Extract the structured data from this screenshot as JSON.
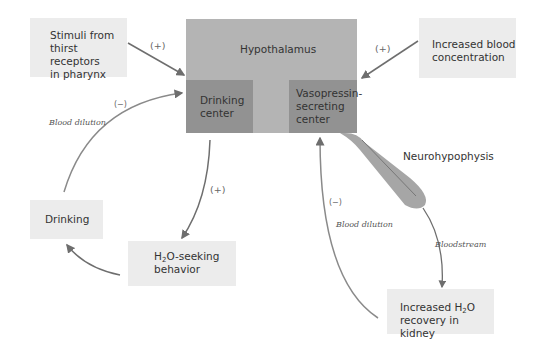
{
  "diagram": {
    "nodes": {
      "stimuli": {
        "line1": "Stimuli from",
        "line2": "thirst receptors",
        "line3": "in  pharynx"
      },
      "blood_conc": {
        "line1": "Increased blood",
        "line2": "concentration"
      },
      "hypothalamus": {
        "label": "Hypothalamus"
      },
      "drinking_center": {
        "line1": "Drinking",
        "line2": "center"
      },
      "vasopressin_center": {
        "line1": "Vasopressin-",
        "line2": "secreting",
        "line3": "center"
      },
      "neurohypophysis": {
        "label": "Neurohypophysis"
      },
      "drinking": {
        "label": "Drinking"
      },
      "h2o_seeking": {
        "line1_pre": "H",
        "line1_sub": "2",
        "line1_post": "O-seeking",
        "line2": "behavior"
      },
      "h2o_recovery": {
        "line1_pre": "Increased H",
        "line1_sub": "2",
        "line1_post": "O",
        "line2": "recovery in kidney"
      }
    },
    "edge_labels": {
      "stimuli_plus": "(+)",
      "blood_conc_plus": "(+)",
      "drinking_center_plus": "(+)",
      "left_minus": "(−)",
      "left_blood_dilution": "Blood dilution",
      "right_minus": "(−)",
      "right_blood_dilution": "Blood dilution",
      "bloodstream": "Bloodstream"
    },
    "colors": {
      "hypothalamus": "#b4b4b4",
      "centers": "#929292",
      "boxes": "#ececec",
      "arrows": "#7a7a7a"
    }
  }
}
